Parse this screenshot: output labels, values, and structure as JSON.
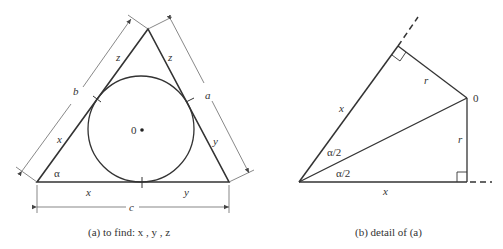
{
  "figure_a": {
    "caption": "(a)  to find:  x , y , z",
    "labels": {
      "center": "0",
      "side_b": "b",
      "side_a": "a",
      "side_c": "c",
      "angle": "α",
      "left_upper": "z",
      "right_upper": "z",
      "left_lower": "x",
      "right_lower": "y",
      "bottom_left": "x",
      "bottom_right": "y"
    }
  },
  "figure_b": {
    "caption": "(b)  detail of (a)",
    "labels": {
      "center": "0",
      "r_upper": "r",
      "r_right": "r",
      "side_x_upper": "x",
      "side_x_lower": "x",
      "half_angle_upper": "α/2",
      "half_angle_lower": "α/2"
    }
  },
  "colors": {
    "line": "#333333",
    "dim_line": "#555555",
    "background": "#ffffff"
  }
}
